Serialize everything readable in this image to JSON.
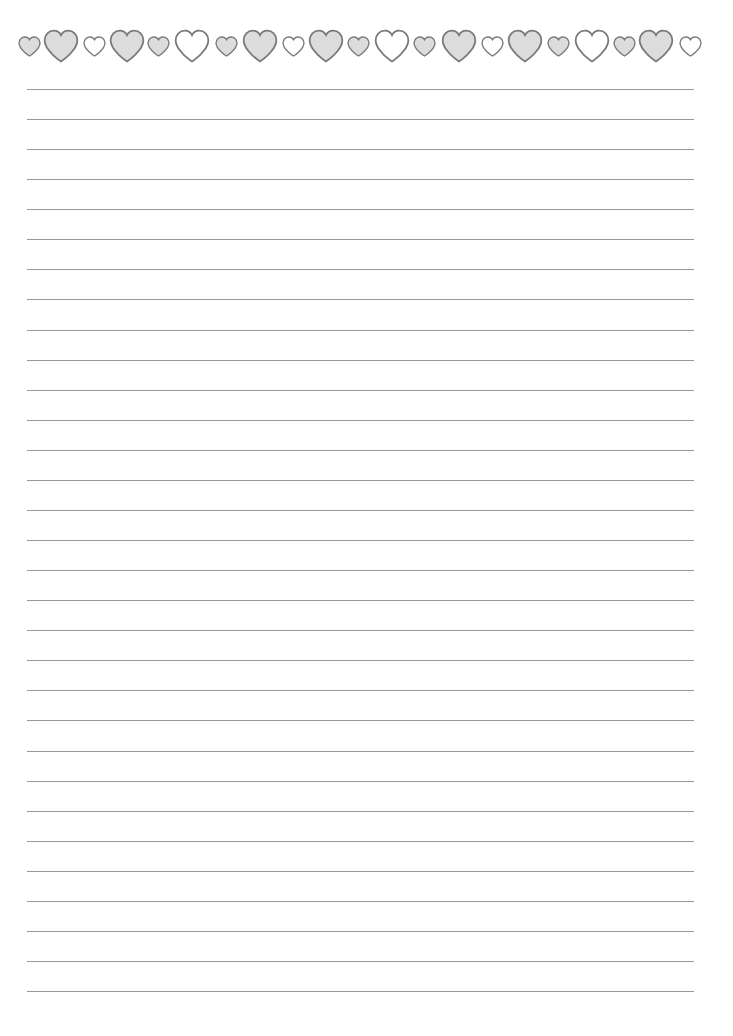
{
  "page": {
    "background": "#ffffff",
    "type": "lined-writing-paper"
  },
  "border": {
    "icon": "heart-icon",
    "stroke_color": "#7a7a7a",
    "gray_fill": "#dcdcdc",
    "white_fill": "#ffffff",
    "hearts": [
      {
        "cx": 29,
        "size": "small",
        "fill": "gray"
      },
      {
        "cx": 61,
        "size": "large",
        "fill": "gray"
      },
      {
        "cx": 94,
        "size": "small",
        "fill": "white"
      },
      {
        "cx": 127,
        "size": "large",
        "fill": "gray"
      },
      {
        "cx": 158,
        "size": "small",
        "fill": "gray"
      },
      {
        "cx": 192,
        "size": "large",
        "fill": "white"
      },
      {
        "cx": 226,
        "size": "small",
        "fill": "gray"
      },
      {
        "cx": 260,
        "size": "large",
        "fill": "gray"
      },
      {
        "cx": 293,
        "size": "small",
        "fill": "white"
      },
      {
        "cx": 326,
        "size": "large",
        "fill": "gray"
      },
      {
        "cx": 358,
        "size": "small",
        "fill": "gray"
      },
      {
        "cx": 392,
        "size": "large",
        "fill": "white"
      },
      {
        "cx": 424,
        "size": "small",
        "fill": "gray"
      },
      {
        "cx": 459,
        "size": "large",
        "fill": "gray"
      },
      {
        "cx": 492,
        "size": "small",
        "fill": "white"
      },
      {
        "cx": 525,
        "size": "large",
        "fill": "gray"
      },
      {
        "cx": 558,
        "size": "small",
        "fill": "gray"
      },
      {
        "cx": 592,
        "size": "large",
        "fill": "white"
      },
      {
        "cx": 624,
        "size": "small",
        "fill": "gray"
      },
      {
        "cx": 656,
        "size": "large",
        "fill": "gray"
      },
      {
        "cx": 690,
        "size": "small",
        "fill": "white"
      }
    ]
  },
  "ruled_lines": {
    "count": 31,
    "first_y": 89,
    "spacing": 30.07,
    "x_start": 27,
    "x_end": 694,
    "color": "#9a9a9a"
  }
}
